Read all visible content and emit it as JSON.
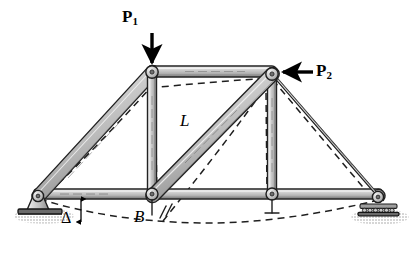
{
  "figure": {
    "type": "structural-truss-diagram"
  },
  "labels": {
    "load_1": "P",
    "load_1_sub": "1",
    "load_2": "P",
    "load_2_sub": "2",
    "member_length": "L",
    "joint_b": "B",
    "deflection": "Δ"
  },
  "colors": {
    "member_fill": "#b9b9b9",
    "member_light": "#e2e2e2",
    "member_dark": "#8a8a8a",
    "outline": "#1a1a1a",
    "ground": "#d8d8d8",
    "arrow": "#000000",
    "dashed": "#222222"
  },
  "geometry": {
    "joints": [
      {
        "name": "left-support",
        "x": 38,
        "y": 196
      },
      {
        "name": "joint-b",
        "x": 152,
        "y": 196
      },
      {
        "name": "joint-bottom-right",
        "x": 272,
        "y": 196
      },
      {
        "name": "top-left",
        "x": 152,
        "y": 72
      },
      {
        "name": "top-right",
        "x": 272,
        "y": 74
      },
      {
        "name": "right-support",
        "x": 378,
        "y": 197
      }
    ],
    "members": [
      {
        "name": "bottom-chord-left",
        "from": "left-support",
        "to": "joint-b"
      },
      {
        "name": "bottom-chord-mid",
        "from": "joint-b",
        "to": "joint-bottom-right"
      },
      {
        "name": "bottom-chord-right",
        "from": "joint-bottom-right",
        "to": "right-support"
      },
      {
        "name": "top-chord",
        "from": "top-left",
        "to": "top-right"
      },
      {
        "name": "left-diagonal",
        "from": "left-support",
        "to": "top-left"
      },
      {
        "name": "right-diagonal",
        "from": "top-right",
        "to": "right-support"
      },
      {
        "name": "vertical-left",
        "from": "joint-b",
        "to": "top-left"
      },
      {
        "name": "vertical-right",
        "from": "joint-bottom-right",
        "to": "top-right"
      },
      {
        "name": "center-diagonal",
        "from": "joint-b",
        "to": "top-right"
      }
    ],
    "supports": [
      {
        "name": "pin-support",
        "x": 38,
        "y": 196,
        "kind": "pin"
      },
      {
        "name": "roller-support",
        "x": 378,
        "y": 197,
        "kind": "roller"
      }
    ]
  },
  "loads": [
    {
      "name": "load-p1",
      "label": "P1",
      "direction": "down",
      "applied_at": "top-left"
    },
    {
      "name": "load-p2",
      "label": "P2",
      "direction": "left",
      "applied_at": "top-right"
    }
  ]
}
